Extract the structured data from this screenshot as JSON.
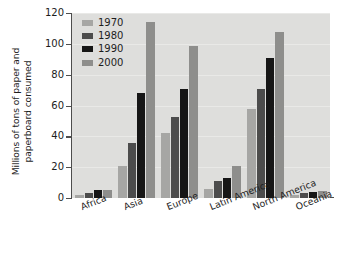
{
  "chart_data": {
    "type": "bar",
    "title": "",
    "xlabel": "",
    "ylabel": "Millions of tons of paper and\npaperboard consumed",
    "ylim": [
      0,
      120
    ],
    "yticks": [
      0,
      20,
      40,
      60,
      80,
      100,
      120
    ],
    "grid": true,
    "legend_position": "top-left",
    "categories": [
      "Africa",
      "Asia",
      "Europe",
      "Latin America",
      "North America",
      "Oceania"
    ],
    "series": [
      {
        "name": "1970",
        "color": "#a6a6a4",
        "values": [
          2,
          21,
          42,
          6,
          58,
          2
        ]
      },
      {
        "name": "1980",
        "color": "#4c4c4c",
        "values": [
          3,
          36,
          52.5,
          11,
          71,
          3
        ]
      },
      {
        "name": "1990",
        "color": "#161616",
        "values": [
          5,
          68,
          71,
          13,
          91,
          4
        ]
      },
      {
        "name": "2000",
        "color": "#8e8e8c",
        "values": [
          5.5,
          114,
          98.5,
          21,
          108,
          4.5
        ]
      }
    ]
  },
  "figure": {
    "background": "#ffffff",
    "plot_background": "#dededc",
    "axis_color": "#4d4d4d"
  }
}
